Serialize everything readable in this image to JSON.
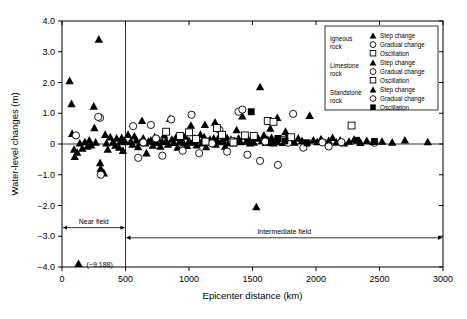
{
  "chart_data": {
    "type": "scatter",
    "title": "",
    "xlabel": "Epicenter distance (km)",
    "ylabel": "Water-level changes (m)",
    "xlim": [
      0,
      3000
    ],
    "ylim": [
      -4.0,
      4.0
    ],
    "xticks": [
      0,
      500,
      1000,
      1500,
      2000,
      2500,
      3000
    ],
    "xticklabels": [
      "0",
      "500",
      "1000",
      "1500",
      "2000",
      "2500",
      "3000"
    ],
    "yticks": [
      -4.0,
      -3.0,
      -2.0,
      -1.0,
      0,
      1.0,
      2.0,
      3.0,
      4.0
    ],
    "yticklabels": [
      "−4.0",
      "−3.0",
      "−2.0",
      "−1.0",
      "0",
      "1.0",
      "2.0",
      "3.0",
      "4.0"
    ],
    "grid": false,
    "zero_reference_line": 0,
    "field_divider_x": 500,
    "legend_position": "upper-right",
    "annotations": [
      {
        "name": "offscale-point",
        "text": "(−9.188)",
        "marker": "filled-triangle",
        "x": 130,
        "y": -3.9
      }
    ],
    "field_spans": [
      {
        "label": "Near field",
        "x_start": 0,
        "x_end": 500,
        "y": -2.72
      },
      {
        "label": "Intermediate field",
        "x_start": 500,
        "x_end": 3000,
        "y": -3.05
      }
    ],
    "legend_groups": [
      {
        "group": "Igneous rock",
        "entries": [
          {
            "label": "Step change",
            "marker": "filled-triangle"
          },
          {
            "label": "Gradual change",
            "marker": "open-circle"
          },
          {
            "label": "Oscillation",
            "marker": "open-square"
          }
        ]
      },
      {
        "group": "Limestone rock",
        "entries": [
          {
            "label": "Step change",
            "marker": "filled-triangle"
          },
          {
            "label": "Gradual change",
            "marker": "open-circle"
          },
          {
            "label": "Oscillation",
            "marker": "open-square"
          }
        ]
      },
      {
        "group": "Standstone rock",
        "entries": [
          {
            "label": "Step change",
            "marker": "filled-triangle"
          },
          {
            "label": "Gradual change",
            "marker": "open-circle"
          },
          {
            "label": "Oscillation",
            "marker": "filled-square"
          }
        ]
      }
    ],
    "series": [
      {
        "name": "Step change",
        "marker": "filled-triangle",
        "points": [
          [
            75,
            1.3
          ],
          [
            80,
            0.33
          ],
          [
            95,
            -0.18
          ],
          [
            100,
            -0.42
          ],
          [
            120,
            -0.28
          ],
          [
            60,
            2.05
          ],
          [
            290,
            3.4
          ],
          [
            250,
            1.22
          ],
          [
            255,
            0.52
          ],
          [
            265,
            0.05
          ],
          [
            300,
            -0.62
          ],
          [
            305,
            -0.8
          ],
          [
            310,
            -0.88
          ],
          [
            330,
            -0.95
          ],
          [
            350,
            0.02
          ],
          [
            400,
            0.05
          ],
          [
            420,
            -0.05
          ],
          [
            430,
            0.18
          ],
          [
            450,
            -0.12
          ],
          [
            460,
            0.08
          ],
          [
            470,
            0.2
          ],
          [
            480,
            -0.22
          ],
          [
            490,
            0.1
          ],
          [
            500,
            0.06
          ],
          [
            520,
            0.3
          ],
          [
            540,
            0.08
          ],
          [
            555,
            -0.02
          ],
          [
            570,
            0.25
          ],
          [
            585,
            0.12
          ],
          [
            600,
            -0.1
          ],
          [
            615,
            0.05
          ],
          [
            630,
            0.75
          ],
          [
            640,
            0.18
          ],
          [
            655,
            0.02
          ],
          [
            665,
            -0.3
          ],
          [
            680,
            0.08
          ],
          [
            700,
            0.12
          ],
          [
            715,
            -0.05
          ],
          [
            730,
            0.22
          ],
          [
            745,
            0.04
          ],
          [
            760,
            0.15
          ],
          [
            775,
            -0.08
          ],
          [
            790,
            0.06
          ],
          [
            805,
            0.28
          ],
          [
            820,
            0.1
          ],
          [
            835,
            -0.02
          ],
          [
            850,
            0.82
          ],
          [
            865,
            0.14
          ],
          [
            880,
            0.04
          ],
          [
            895,
            0.2
          ],
          [
            910,
            -0.12
          ],
          [
            925,
            0.08
          ],
          [
            940,
            0.16
          ],
          [
            955,
            0.02
          ],
          [
            970,
            0.24
          ],
          [
            985,
            -0.06
          ],
          [
            1000,
            0.1
          ],
          [
            1015,
            0.6
          ],
          [
            1030,
            0.05
          ],
          [
            1045,
            0.18
          ],
          [
            1060,
            -0.04
          ],
          [
            1075,
            0.12
          ],
          [
            1090,
            0.3
          ],
          [
            1105,
            0.02
          ],
          [
            1120,
            0.22
          ],
          [
            1135,
            -0.1
          ],
          [
            1150,
            0.08
          ],
          [
            1165,
            0.14
          ],
          [
            1180,
            0.04
          ],
          [
            1195,
            0.18
          ],
          [
            1210,
            -0.02
          ],
          [
            1225,
            0.1
          ],
          [
            1240,
            0.26
          ],
          [
            1255,
            0.06
          ],
          [
            1270,
            0.12
          ],
          [
            1285,
            -0.08
          ],
          [
            1300,
            0.2
          ],
          [
            1315,
            0.04
          ],
          [
            1330,
            0.14
          ],
          [
            1345,
            0.02
          ],
          [
            1360,
            0.1
          ],
          [
            1375,
            0.45
          ],
          [
            1390,
            0.18
          ],
          [
            1405,
            0.06
          ],
          [
            1420,
            0.9
          ],
          [
            1435,
            0.24
          ],
          [
            1450,
            0.08
          ],
          [
            1465,
            0.16
          ],
          [
            1480,
            0.02
          ],
          [
            1495,
            0.12
          ],
          [
            1510,
            0.05
          ],
          [
            1530,
            -2.05
          ],
          [
            1545,
            0.18
          ],
          [
            1560,
            1.85
          ],
          [
            1575,
            0.1
          ],
          [
            1590,
            0.28
          ],
          [
            1605,
            0.04
          ],
          [
            1620,
            0.14
          ],
          [
            1635,
            0.08
          ],
          [
            1650,
            0.2
          ],
          [
            1665,
            0.02
          ],
          [
            1680,
            0.12
          ],
          [
            1695,
            0.85
          ],
          [
            1710,
            0.06
          ],
          [
            1725,
            0.16
          ],
          [
            1740,
            0.04
          ],
          [
            1755,
            0.1
          ],
          [
            1770,
            0.22
          ],
          [
            1785,
            0.08
          ],
          [
            1800,
            0.14
          ],
          [
            1830,
            0.05
          ],
          [
            1860,
            0.18
          ],
          [
            1890,
            0.1
          ],
          [
            1920,
            0.02
          ],
          [
            1950,
            0.92
          ],
          [
            1980,
            0.12
          ],
          [
            2010,
            0.06
          ],
          [
            2040,
            0.16
          ],
          [
            2070,
            0.04
          ],
          [
            2100,
            0.1
          ],
          [
            2130,
            0.2
          ],
          [
            2160,
            0.05
          ],
          [
            2190,
            0.12
          ],
          [
            2220,
            0.02
          ],
          [
            2260,
            0.08
          ],
          [
            2300,
            0.14
          ],
          [
            2350,
            0.04
          ],
          [
            2400,
            0.1
          ],
          [
            2450,
            0.06
          ],
          [
            2520,
            0.08
          ],
          [
            2600,
            0.05
          ],
          [
            2700,
            0.12
          ],
          [
            2880,
            0.06
          ],
          [
            140,
            0.02
          ],
          [
            160,
            -0.15
          ],
          [
            180,
            0.06
          ],
          [
            200,
            -0.08
          ],
          [
            215,
            0.12
          ],
          [
            230,
            -0.04
          ],
          [
            340,
            0.3
          ],
          [
            360,
            -0.18
          ],
          [
            380,
            0.22
          ],
          [
            1125,
            0.62
          ],
          [
            1205,
            0.7
          ],
          [
            1640,
            0.5
          ],
          [
            1760,
            0.4
          ]
        ]
      },
      {
        "name": "Gradual change",
        "marker": "open-circle",
        "points": [
          [
            110,
            0.28
          ],
          [
            300,
            0.85
          ],
          [
            305,
            -1.0
          ],
          [
            285,
            0.88
          ],
          [
            560,
            0.58
          ],
          [
            600,
            -0.45
          ],
          [
            640,
            0.05
          ],
          [
            700,
            0.62
          ],
          [
            790,
            -0.38
          ],
          [
            860,
            0.8
          ],
          [
            1020,
            0.95
          ],
          [
            1080,
            -0.3
          ],
          [
            1180,
            0.02
          ],
          [
            1300,
            -0.25
          ],
          [
            1390,
            1.05
          ],
          [
            1420,
            1.12
          ],
          [
            1460,
            -0.35
          ],
          [
            1560,
            -0.55
          ],
          [
            1600,
            0.08
          ],
          [
            1700,
            -0.68
          ],
          [
            1780,
            0.04
          ],
          [
            1820,
            0.98
          ],
          [
            1900,
            -0.12
          ],
          [
            2050,
            0.05
          ],
          [
            2200,
            0.06
          ],
          [
            2460,
            0.04
          ],
          [
            2100,
            -0.08
          ],
          [
            1240,
            0.46
          ],
          [
            950,
            -0.22
          ],
          [
            1340,
            0.1
          ],
          [
            740,
            0.18
          ]
        ]
      },
      {
        "name": "Oscillation (open)",
        "marker": "open-square",
        "points": [
          [
            820,
            0.4
          ],
          [
            1000,
            0.38
          ],
          [
            1055,
            0.16
          ],
          [
            1220,
            0.52
          ],
          [
            1260,
            0.3
          ],
          [
            1440,
            0.28
          ],
          [
            1510,
            0.26
          ],
          [
            1620,
            0.75
          ],
          [
            1665,
            0.72
          ],
          [
            1740,
            0.14
          ],
          [
            1805,
            0.22
          ],
          [
            2280,
            0.6
          ],
          [
            1130,
            0.08
          ],
          [
            1350,
            0.05
          ],
          [
            930,
            0.26
          ]
        ]
      },
      {
        "name": "Oscillation (filled)",
        "marker": "filled-square",
        "points": [
          [
            1490,
            1.05
          ],
          [
            1700,
            0.18
          ],
          [
            1755,
            0.1
          ],
          [
            1650,
            0.06
          ],
          [
            2320,
            0.12
          ],
          [
            1930,
            0.04
          ],
          [
            2460,
            0.08
          ]
        ]
      }
    ]
  }
}
